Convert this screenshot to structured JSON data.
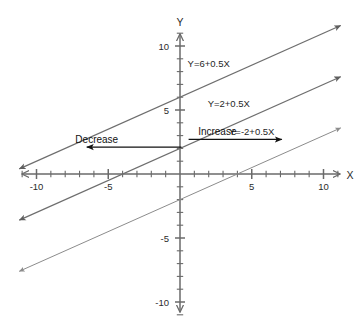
{
  "chart_data": {
    "type": "line",
    "title": "",
    "xlabel": "X",
    "ylabel": "Y",
    "xlim": [
      -11.5,
      11.5
    ],
    "ylim": [
      -11.5,
      11.5
    ],
    "grid": false,
    "legend_position": "inline-labels",
    "x_ticks": [
      -11,
      -10,
      -9,
      -8,
      -7,
      -6,
      -5,
      -4,
      -3,
      -2,
      -1,
      1,
      2,
      3,
      4,
      5,
      6,
      7,
      8,
      9,
      10,
      11
    ],
    "y_ticks": [
      -11,
      -10,
      -9,
      -8,
      -7,
      -6,
      -5,
      -4,
      -3,
      -2,
      -1,
      1,
      2,
      3,
      4,
      5,
      6,
      7,
      8,
      9,
      10,
      11
    ],
    "x_tick_labels": [
      {
        "value": -10,
        "text": "-10"
      },
      {
        "value": -5,
        "text": "-5"
      },
      {
        "value": 5,
        "text": "5"
      },
      {
        "value": 10,
        "text": "10"
      }
    ],
    "y_tick_labels": [
      {
        "value": 10,
        "text": "10"
      },
      {
        "value": 5,
        "text": "5"
      },
      {
        "value": -5,
        "text": "-5"
      },
      {
        "value": -10,
        "text": "-10"
      }
    ],
    "series": [
      {
        "name": "Y=6+0.5X",
        "label": "Y=6+0.5X",
        "slope": 0.5,
        "intercept": 6,
        "color": "#6e6e6e",
        "x_start": -11.2,
        "x_end": 11.2,
        "arrows": "both",
        "label_x": 2.0,
        "label_y": 8.6
      },
      {
        "name": "Y=2+0.5X",
        "label": "Y=2+0.5X",
        "slope": 0.5,
        "intercept": 2,
        "color": "#6e6e6e",
        "x_start": -11.2,
        "x_end": 11.2,
        "arrows": "both",
        "label_x": 3.4,
        "label_y": 5.5
      },
      {
        "name": "Y=-2+0.5X",
        "label": "Y=-2+0.5X",
        "slope": 0.5,
        "intercept": -2,
        "color": "#8c8c8c",
        "x_start": -11.2,
        "x_end": 11.2,
        "arrows": "both",
        "label_x": 5.0,
        "label_y": 3.3
      }
    ],
    "annotations": [
      {
        "name": "decrease",
        "text": "Decrease",
        "direction": "left",
        "text_x": -5.8,
        "text_y": 2.7,
        "arrow_x_start": 0.1,
        "arrow_x_end": -6.5,
        "arrow_y": 2.1,
        "color": "#111111"
      },
      {
        "name": "increase",
        "text": "Increase",
        "direction": "right",
        "text_x": 2.6,
        "text_y": 3.3,
        "arrow_x_start": 0.6,
        "arrow_x_end": 7.1,
        "arrow_y": 2.7,
        "color": "#111111"
      }
    ],
    "axis_color": "#6a6a6a",
    "background_color": "#ffffff"
  },
  "axes": {
    "x_name": "X",
    "y_name": "Y"
  }
}
